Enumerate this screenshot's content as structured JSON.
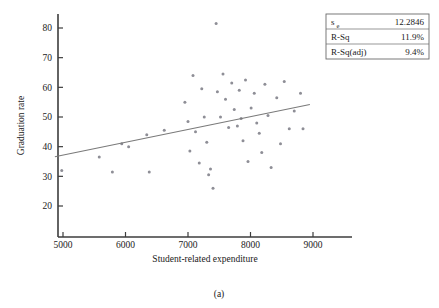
{
  "figure": {
    "caption": "(a)"
  },
  "stats_box": {
    "rows": [
      {
        "label": "s",
        "sub": "e",
        "value": "12.2846"
      },
      {
        "label": "R-Sq",
        "sub": "",
        "value": "11.9%"
      },
      {
        "label": "R-Sq(adj)",
        "sub": "",
        "value": "9.4%"
      }
    ]
  },
  "chart_data": {
    "type": "scatter",
    "title": "",
    "xlabel": "Student-related expenditure",
    "ylabel": "Graduation rate",
    "xlim": [
      4700,
      9150
    ],
    "ylim": [
      17,
      84
    ],
    "xticks": [
      5000,
      6000,
      7000,
      8000,
      9000
    ],
    "xticklabels": [
      "5000",
      "6000",
      "7000",
      "8000",
      "9000"
    ],
    "yticks": [
      20,
      30,
      40,
      50,
      60,
      70,
      80
    ],
    "yticklabels": [
      "20",
      "30",
      "40",
      "50",
      "60",
      "70",
      "80"
    ],
    "grid": false,
    "legend": "none",
    "marker": {
      "shape": "circle",
      "size": 3.0,
      "color": "#8e8e96"
    },
    "points": [
      {
        "x": 4980,
        "y": 32.0
      },
      {
        "x": 5580,
        "y": 36.5
      },
      {
        "x": 5790,
        "y": 31.5
      },
      {
        "x": 5940,
        "y": 41.0
      },
      {
        "x": 6050,
        "y": 40.0
      },
      {
        "x": 6340,
        "y": 44.0
      },
      {
        "x": 6380,
        "y": 31.5
      },
      {
        "x": 6620,
        "y": 45.5
      },
      {
        "x": 6950,
        "y": 55.0
      },
      {
        "x": 7000,
        "y": 48.5
      },
      {
        "x": 7030,
        "y": 38.5
      },
      {
        "x": 7080,
        "y": 64.0
      },
      {
        "x": 7120,
        "y": 45.0
      },
      {
        "x": 7180,
        "y": 34.5
      },
      {
        "x": 7220,
        "y": 59.5
      },
      {
        "x": 7260,
        "y": 50.0
      },
      {
        "x": 7300,
        "y": 41.5
      },
      {
        "x": 7330,
        "y": 30.5
      },
      {
        "x": 7360,
        "y": 32.5
      },
      {
        "x": 7400,
        "y": 26.0
      },
      {
        "x": 7450,
        "y": 81.5
      },
      {
        "x": 7470,
        "y": 58.5
      },
      {
        "x": 7520,
        "y": 50.0
      },
      {
        "x": 7560,
        "y": 64.5
      },
      {
        "x": 7600,
        "y": 56.0
      },
      {
        "x": 7650,
        "y": 46.5
      },
      {
        "x": 7700,
        "y": 61.5
      },
      {
        "x": 7740,
        "y": 52.5
      },
      {
        "x": 7790,
        "y": 47.0
      },
      {
        "x": 7820,
        "y": 59.0
      },
      {
        "x": 7850,
        "y": 49.5
      },
      {
        "x": 7880,
        "y": 42.0
      },
      {
        "x": 7920,
        "y": 62.5
      },
      {
        "x": 7960,
        "y": 35.0
      },
      {
        "x": 8010,
        "y": 53.0
      },
      {
        "x": 8060,
        "y": 58.0
      },
      {
        "x": 8100,
        "y": 48.0
      },
      {
        "x": 8140,
        "y": 44.5
      },
      {
        "x": 8180,
        "y": 38.0
      },
      {
        "x": 8230,
        "y": 61.0
      },
      {
        "x": 8280,
        "y": 50.5
      },
      {
        "x": 8330,
        "y": 33.0
      },
      {
        "x": 8420,
        "y": 56.5
      },
      {
        "x": 8480,
        "y": 41.0
      },
      {
        "x": 8540,
        "y": 62.0
      },
      {
        "x": 8620,
        "y": 46.0
      },
      {
        "x": 8700,
        "y": 52.0
      },
      {
        "x": 8800,
        "y": 58.0
      },
      {
        "x": 8840,
        "y": 46.0
      }
    ],
    "fit_line": {
      "label": "regression line",
      "x_start": 4870,
      "y_start": 36.6,
      "x_end": 8950,
      "y_end": 54.2
    }
  }
}
